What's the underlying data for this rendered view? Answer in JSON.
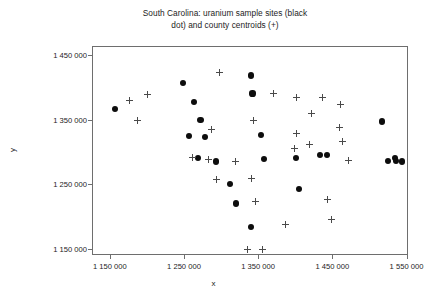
{
  "chart_data": {
    "type": "scatter",
    "title": "South Carolina: uranium sample sites (black\ndot) and county centroids (+)",
    "xlabel": "x",
    "ylabel": "y",
    "xlim": [
      1126000,
      1552000
    ],
    "ylim": [
      1141000,
      1464000
    ],
    "grid": false,
    "legend": "none",
    "xticks": [
      1150000,
      1250000,
      1350000,
      1450000,
      1550000
    ],
    "xticklabels": [
      "1 150 000",
      "1 250 000",
      "1 350 000",
      "1 450 000",
      "1 550 000"
    ],
    "yticks": [
      1150000,
      1250000,
      1350000,
      1450000
    ],
    "yticklabels": [
      "1 150 000",
      "1 250 000",
      "1 350 000",
      "1 450 000"
    ],
    "series": [
      {
        "name": "uranium sample sites",
        "marker": "black dot",
        "color": "#0d0d0d",
        "points": [
          [
            1156000,
            1368000
          ],
          [
            1247000,
            1408000
          ],
          [
            1262000,
            1379000
          ],
          [
            1271000,
            1351000
          ],
          [
            1339000,
            1420000
          ],
          [
            1341000,
            1392000
          ],
          [
            1255000,
            1327000
          ],
          [
            1277000,
            1325000
          ],
          [
            1268000,
            1293000
          ],
          [
            1292000,
            1287000
          ],
          [
            1352000,
            1328000
          ],
          [
            1357000,
            1291000
          ],
          [
            1311000,
            1252000
          ],
          [
            1319000,
            1222000
          ],
          [
            1339000,
            1186000
          ],
          [
            1404000,
            1245000
          ],
          [
            1400000,
            1292000
          ],
          [
            1432000,
            1297000
          ],
          [
            1442000,
            1297000
          ],
          [
            1516000,
            1349000
          ],
          [
            1524000,
            1288000
          ],
          [
            1533000,
            1293000
          ],
          [
            1535000,
            1288000
          ],
          [
            1543000,
            1287000
          ]
        ]
      },
      {
        "name": "county centroids",
        "marker": "plus",
        "color": "#4a4a4a",
        "points": [
          [
            1175000,
            1381000
          ],
          [
            1199000,
            1390000
          ],
          [
            1296000,
            1424000
          ],
          [
            1186000,
            1351000
          ],
          [
            1260000,
            1294000
          ],
          [
            1342000,
            1350000
          ],
          [
            1369000,
            1392000
          ],
          [
            1400000,
            1330000
          ],
          [
            1400000,
            1386000
          ],
          [
            1421000,
            1362000
          ],
          [
            1435000,
            1386000
          ],
          [
            1459000,
            1375000
          ],
          [
            1458000,
            1340000
          ],
          [
            1462000,
            1318000
          ],
          [
            1418000,
            1314000
          ],
          [
            1286000,
            1336000
          ],
          [
            1282000,
            1290000
          ],
          [
            1318000,
            1287000
          ],
          [
            1397000,
            1307000
          ],
          [
            1340000,
            1261000
          ],
          [
            1292000,
            1259000
          ],
          [
            1471000,
            1288000
          ],
          [
            1442000,
            1228000
          ],
          [
            1345000,
            1225000
          ],
          [
            1448000,
            1198000
          ],
          [
            1386000,
            1190000
          ],
          [
            1334000,
            1151000
          ],
          [
            1354000,
            1151000
          ]
        ]
      }
    ]
  }
}
